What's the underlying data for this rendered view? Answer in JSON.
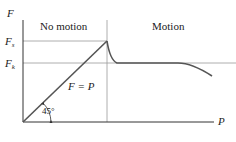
{
  "diagram": {
    "y_axis_label": "F",
    "x_axis_label": "P",
    "y_ticks": {
      "fs_main": "F",
      "fs_sub": "s",
      "fk_main": "F",
      "fk_sub": "k"
    },
    "regions": {
      "left": "No motion",
      "right": "Motion"
    },
    "line_label": "F = P",
    "angle_label": "45°",
    "colors": {
      "axis": "#333333",
      "curve": "#555555",
      "guide": "#9a9a9a",
      "text": "#222222"
    }
  }
}
